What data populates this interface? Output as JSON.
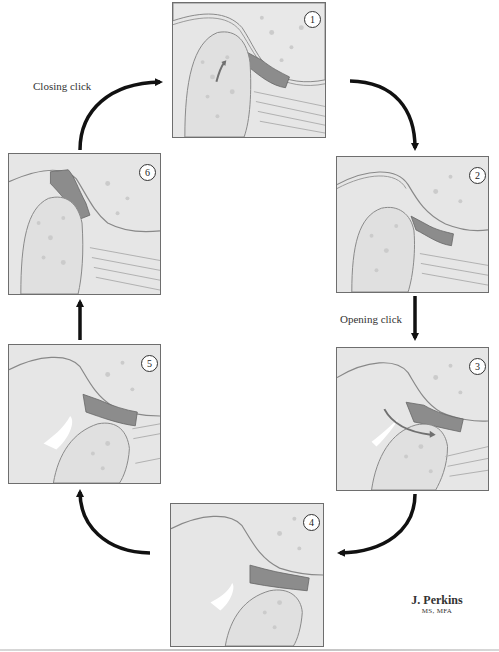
{
  "figure": {
    "labels": {
      "closing_click": "Closing click",
      "opening_click": "Opening click"
    },
    "panels": [
      {
        "id": 1,
        "number": "1",
        "condyle": "closed",
        "disc": "anteriorly displaced",
        "arrow": "condyle rotation"
      },
      {
        "id": 2,
        "number": "2",
        "condyle": "beginning to open",
        "disc": "anteriorly displaced"
      },
      {
        "id": 3,
        "number": "3",
        "condyle": "translating",
        "disc": "reducing onto condyle",
        "arrow": "condyle snaps under disc"
      },
      {
        "id": 4,
        "number": "4",
        "condyle": "fully open",
        "disc": "reduced"
      },
      {
        "id": 5,
        "number": "5",
        "condyle": "closing",
        "disc": "reduced"
      },
      {
        "id": 6,
        "number": "6",
        "condyle": "closed",
        "disc": "re-displaced anteriorly"
      }
    ],
    "signature": {
      "name": "J. Perkins",
      "credentials": "MS, MFA"
    },
    "colors": {
      "bone": "#e3e3e3",
      "bone_texture": "#c9c9c9",
      "disc": "#8c8c8c",
      "muscle": "#cfcfcf",
      "cycle_arrow": "#111111",
      "panel_border": "#6e6e6e"
    }
  }
}
